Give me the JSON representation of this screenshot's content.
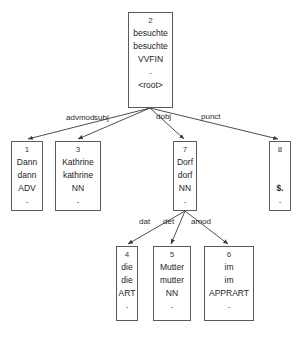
{
  "diagram": {
    "type": "dependency-parse-tree",
    "nodes": [
      {
        "id": "node-2",
        "index": "2",
        "form": "besuchte",
        "lemma": "besuchte",
        "pos": "VVFIN",
        "feats": "-",
        "extra": "<root>",
        "x": 128,
        "y": 12,
        "w": 45,
        "h": 96
      },
      {
        "id": "node-1",
        "index": "1",
        "form": "Dann",
        "lemma": "dann",
        "pos": "ADV",
        "feats": "-",
        "extra": "",
        "x": 11,
        "y": 141,
        "w": 32,
        "h": 70
      },
      {
        "id": "node-3",
        "index": "3",
        "form": "Kathrine",
        "lemma": "kathrine",
        "pos": "NN",
        "feats": "-",
        "extra": "",
        "x": 55,
        "y": 141,
        "w": 46,
        "h": 70
      },
      {
        "id": "node-7",
        "index": "7",
        "form": "Dorf",
        "lemma": "dorf",
        "pos": "NN",
        "feats": "-",
        "extra": "",
        "x": 173,
        "y": 141,
        "w": 24,
        "h": 70
      },
      {
        "id": "node-8",
        "index": "8",
        "form": ".",
        "lemma": ".",
        "pos": "$.",
        "feats": "-",
        "extra": "",
        "x": 269,
        "y": 141,
        "w": 22,
        "h": 70
      },
      {
        "id": "node-4",
        "index": "4",
        "form": "die",
        "lemma": "die",
        "pos": "ART",
        "feats": "-",
        "extra": "",
        "x": 116,
        "y": 246,
        "w": 22,
        "h": 75
      },
      {
        "id": "node-5",
        "index": "5",
        "form": "Mutter",
        "lemma": "mutter",
        "pos": "NN",
        "feats": "-",
        "extra": "",
        "x": 153,
        "y": 246,
        "w": 38,
        "h": 75
      },
      {
        "id": "node-6",
        "index": "6",
        "form": "im",
        "lemma": "im",
        "pos": "APPRART",
        "feats": "-",
        "extra": "",
        "x": 204,
        "y": 246,
        "w": 50,
        "h": 75
      }
    ],
    "edges": [
      {
        "id": "edge-advmod",
        "label": "advmod",
        "from": "node-2",
        "to": "node-1",
        "label_x": 66,
        "label_y": 113
      },
      {
        "id": "edge-subj",
        "label": "subj",
        "from": "node-2",
        "to": "node-3",
        "label_x": 94,
        "label_y": 113
      },
      {
        "id": "edge-dobj",
        "label": "dobj",
        "from": "node-2",
        "to": "node-7",
        "label_x": 156,
        "label_y": 112
      },
      {
        "id": "edge-punct",
        "label": "punct",
        "from": "node-2",
        "to": "node-8",
        "label_x": 201,
        "label_y": 112
      },
      {
        "id": "edge-dat",
        "label": "dat",
        "from": "node-7",
        "to": "node-4",
        "label_x": 139,
        "label_y": 217
      },
      {
        "id": "edge-det",
        "label": "det",
        "from": "node-7",
        "to": "node-5",
        "label_x": 163,
        "label_y": 217
      },
      {
        "id": "edge-amod",
        "label": "amod",
        "from": "node-7",
        "to": "node-6",
        "label_x": 191,
        "label_y": 217
      }
    ],
    "colors": {
      "border": "#5a5a5a",
      "text": "#1c1c1c",
      "edge": "#3a3a3a",
      "background": "#ffffff"
    }
  }
}
